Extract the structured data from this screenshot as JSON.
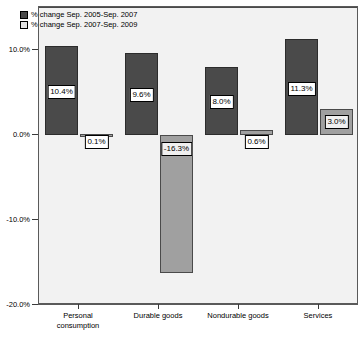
{
  "chart_data": {
    "type": "bar",
    "title": "",
    "xlabel": "",
    "ylabel": "",
    "ylim": [
      -20.0,
      15.0
    ],
    "yticks": [
      "10.0%",
      "0.0%",
      "-10.0%",
      "-20.0%"
    ],
    "ytick_values": [
      10.0,
      0.0,
      -10.0,
      -20.0
    ],
    "grid": false,
    "legend_position": "top-left",
    "categories": [
      "Personal\nconsumption",
      "Durable goods",
      "Nondurable goods",
      "Services"
    ],
    "series": [
      {
        "name": "% change Sep. 2005-Sep. 2007",
        "color": "#4a4a4a",
        "values": [
          10.4,
          9.6,
          8.0,
          11.3
        ],
        "labels": [
          "10.4%",
          "9.6%",
          "8.0%",
          "11.3%"
        ]
      },
      {
        "name": "% change Sep. 2007-Sep. 2009",
        "color": "#a0a0a0",
        "values": [
          0.1,
          -16.3,
          0.6,
          3.0
        ],
        "labels": [
          "0.1%",
          "-16.3%",
          "0.6%",
          "3.0%"
        ]
      }
    ]
  },
  "legend": {
    "items": [
      {
        "label": "% change Sep. 2005-Sep. 2007",
        "swatch": "dark-gray-swatch"
      },
      {
        "label": "% change Sep. 2007-Sep. 2009",
        "swatch": "light-gray-swatch"
      }
    ]
  },
  "axis": {
    "y": {
      "ticks": [
        {
          "label": "10.0%"
        },
        {
          "label": "0.0%"
        },
        {
          "label": "-10.0%"
        },
        {
          "label": "-20.0%"
        }
      ]
    },
    "x": {
      "ticks": [
        {
          "label": "Personal\nconsumption"
        },
        {
          "label": "Durable goods"
        },
        {
          "label": "Nondurable goods"
        },
        {
          "label": "Services"
        }
      ]
    }
  },
  "colors": {
    "series1": "#4a4a4a",
    "series2": "#a0a0a0",
    "plot_background": "#f2f2f2",
    "frame": "#5a5a5a",
    "label_box_background": "#ffffff"
  }
}
